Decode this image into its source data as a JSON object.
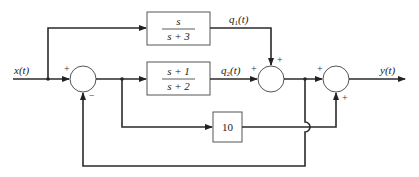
{
  "diagram": {
    "type": "block-diagram",
    "input_label": "x(t)",
    "output_label": "y(t)",
    "blocks": [
      {
        "id": "block1",
        "numerator": "s",
        "denominator": "s + 3",
        "output_label": "q1(t)"
      },
      {
        "id": "block2",
        "numerator": "s + 1",
        "denominator": "s + 2",
        "output_label": "q2(t)"
      },
      {
        "id": "block3",
        "gain": "10"
      }
    ],
    "summers": [
      {
        "id": "sum1",
        "signs": {
          "left": "+",
          "bottom": "−"
        }
      },
      {
        "id": "sum2",
        "signs": {
          "left": "+",
          "top": "+"
        }
      },
      {
        "id": "sum3",
        "signs": {
          "left": "+",
          "bottom": "+"
        }
      }
    ],
    "q1_sub": "1",
    "q2_sub": "2",
    "q_base": "q",
    "q_arg": "(t)"
  }
}
